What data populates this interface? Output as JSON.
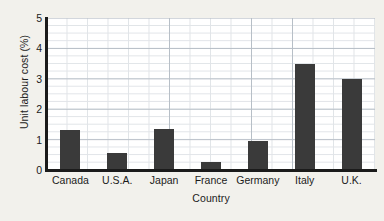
{
  "chart_data": {
    "type": "bar",
    "title": "",
    "xlabel": "Country",
    "ylabel": "Unit labour cost (%)",
    "categories": [
      "Canada",
      "U.S.A.",
      "Japan",
      "France",
      "Germany",
      "Italy",
      "U.K."
    ],
    "values": [
      1.3,
      0.55,
      1.35,
      0.25,
      0.95,
      3.5,
      3.0
    ],
    "ylim": [
      0,
      5
    ],
    "yticks": [
      0,
      1,
      2,
      3,
      4,
      5
    ],
    "ytick_labels": [
      "0",
      "1",
      "2",
      "3",
      "4",
      "5"
    ],
    "grid": true,
    "grid_minor_step": 0.25,
    "legend": "none",
    "bar_color": "#3a3a3a",
    "plot_background": "#ffffff",
    "figure_background": "#f2f1ec",
    "axis_color": "#1b1b1b",
    "grid_color": "#c9cfd6"
  }
}
